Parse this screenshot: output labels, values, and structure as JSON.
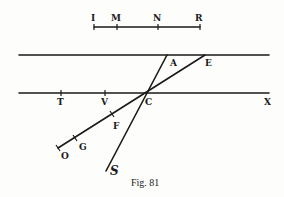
{
  "figure": {
    "caption": "Fig. 81",
    "scale_segment": {
      "labels": [
        {
          "text": "I",
          "x": 94
        },
        {
          "text": "M",
          "x": 117
        },
        {
          "text": "N",
          "x": 158
        },
        {
          "text": "R",
          "x": 200
        }
      ]
    },
    "parallel_lines": {
      "upper": {
        "labels": [
          {
            "text": "A"
          },
          {
            "text": "E"
          }
        ]
      },
      "lower": {
        "labels": [
          {
            "text": "T"
          },
          {
            "text": "V"
          },
          {
            "text": "C"
          },
          {
            "text": "X"
          }
        ]
      }
    },
    "rays": {
      "lower_left_ray": {
        "labels": [
          {
            "text": "F"
          },
          {
            "text": "G"
          },
          {
            "text": "O"
          }
        ]
      },
      "steep_ray": {
        "labels": [
          {
            "text": "S"
          }
        ]
      }
    },
    "colors": {
      "ink": "#1a1a1a",
      "paper": "#fdfdfb"
    }
  }
}
